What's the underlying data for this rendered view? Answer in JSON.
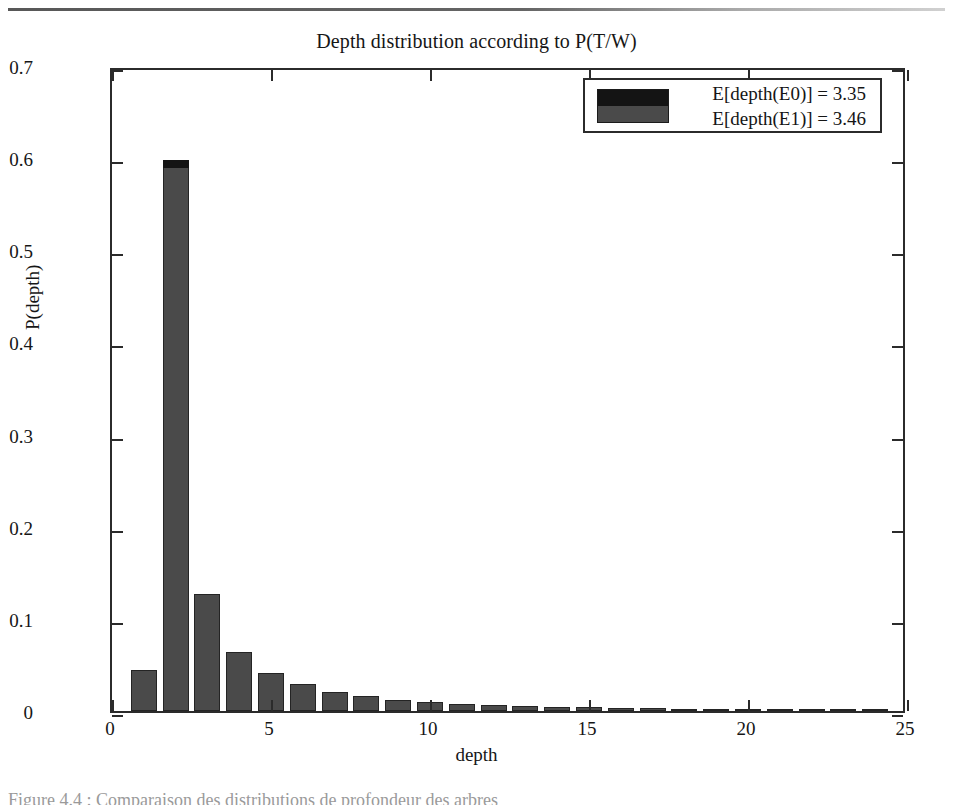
{
  "figure": {
    "title": "Depth distribution according to P(T/W)",
    "caption": "Figure 4.4 : Comparaison des distributions de profondeur des arbres"
  },
  "legend": {
    "entries": [
      {
        "label": "E[depth(E0)] = 3.35",
        "color": "#141414"
      },
      {
        "label": "E[depth(E1)] = 3.46",
        "color": "#4a4a4a"
      }
    ]
  },
  "chart_data": {
    "type": "bar",
    "title": "Depth distribution according to P(T/W)",
    "xlabel": "depth",
    "ylabel": "P(depth)",
    "xlim": [
      0,
      25
    ],
    "ylim": [
      0,
      0.7
    ],
    "xticks": [
      0,
      5,
      10,
      15,
      20,
      25
    ],
    "xtick_labels": [
      "0",
      "5",
      "10",
      "15",
      "20",
      "25"
    ],
    "yticks": [
      0,
      0.1,
      0.2,
      0.3,
      0.4,
      0.5,
      0.6,
      0.7
    ],
    "ytick_labels": [
      "0",
      "0.1",
      "0.2",
      "0.3",
      "0.4",
      "0.5",
      "0.6",
      "0.7"
    ],
    "grid": false,
    "legend_position": "upper right",
    "categories": [
      1,
      2,
      3,
      4,
      5,
      6,
      7,
      8,
      9,
      10,
      11,
      12,
      13,
      14,
      15,
      16,
      17,
      18,
      19,
      20,
      21,
      22,
      23,
      24
    ],
    "series": [
      {
        "name": "E[depth(E0)] = 3.35",
        "color": "#141414",
        "values": [
          0.045,
          0.598,
          0.127,
          0.064,
          0.041,
          0.029,
          0.021,
          0.016,
          0.012,
          0.01,
          0.008,
          0.006,
          0.005,
          0.004,
          0.004,
          0.003,
          0.003,
          0.002,
          0.002,
          0.002,
          0.001,
          0.001,
          0.001,
          0.001
        ]
      },
      {
        "name": "E[depth(E1)] = 3.46",
        "color": "#4a4a4a",
        "values": [
          0.045,
          0.593,
          0.127,
          0.064,
          0.041,
          0.029,
          0.021,
          0.016,
          0.012,
          0.01,
          0.008,
          0.006,
          0.005,
          0.004,
          0.004,
          0.003,
          0.003,
          0.002,
          0.002,
          0.002,
          0.001,
          0.001,
          0.001,
          0.001
        ]
      }
    ]
  }
}
